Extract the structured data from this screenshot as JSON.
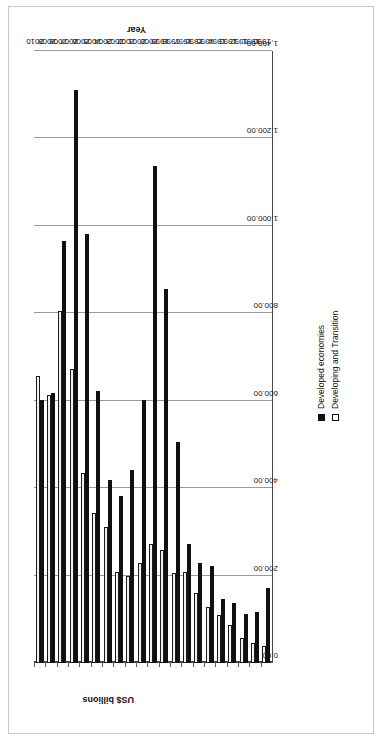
{
  "chart_data": {
    "type": "bar",
    "orientation": "horizontal",
    "title": "",
    "xlabel": "US$ billions",
    "ylabel": "Year",
    "value_axis_title": "US$ billions",
    "category_axis_title": "Year",
    "grid": true,
    "legend_position": "top-right",
    "xlim": [
      0,
      1400
    ],
    "ticks": [
      "0.00",
      "200.00",
      "400.00",
      "600.00",
      "800.00",
      "1,000.00",
      "1,200.00",
      "1,400.00"
    ],
    "tick_values": [
      0,
      200,
      400,
      600,
      800,
      1000,
      1200,
      1400
    ],
    "categories": [
      "1990",
      "1991",
      "1992",
      "1993",
      "1994",
      "1995",
      "1996",
      "1997",
      "1998",
      "1999",
      "2000",
      "2001",
      "2002",
      "2003",
      "2004",
      "2005",
      "2006",
      "2007",
      "2008",
      "2009",
      "2010"
    ],
    "series": [
      {
        "name": "Developed economies",
        "color": "#111111",
        "style": "filled",
        "values": [
          172,
          117,
          112,
          138,
          146,
          222,
          228,
          272,
          505,
          855,
          1138,
          601,
          441,
          381,
          419,
          623,
          982,
          1310,
          965,
          618,
          602
        ]
      },
      {
        "name": "Developing and Transition",
        "color": "#f2f2f2",
        "style": "outlined",
        "values": [
          38,
          45,
          57,
          86,
          110,
          128,
          159,
          208,
          205,
          258,
          272,
          229,
          199,
          209,
          311,
          344,
          434,
          673,
          806,
          612,
          657
        ]
      }
    ]
  },
  "legend": {
    "items": [
      {
        "label": "Developed economies",
        "marker": "filled-square-marker"
      },
      {
        "label": "Developing and Transition",
        "marker": "outlined-square-marker"
      }
    ]
  },
  "axes": {
    "value": {
      "title": "US$ billions",
      "labels": [
        "0.00",
        "200.00",
        "400.00",
        "600.00",
        "800.00",
        "1,000.00",
        "1,200.00",
        "1,400.00"
      ]
    },
    "category": {
      "title": "Year",
      "labels": [
        "1990",
        "1991",
        "1992",
        "1993",
        "1994",
        "1995",
        "1996",
        "1997",
        "1998",
        "1999",
        "2000",
        "2001",
        "2002",
        "2003",
        "2004",
        "2005",
        "2006",
        "2007",
        "2008",
        "2009",
        "2010"
      ]
    }
  }
}
